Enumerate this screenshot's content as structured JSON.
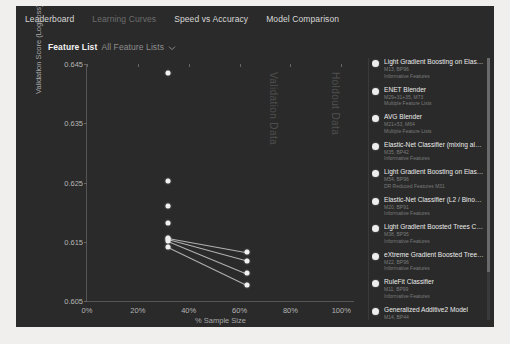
{
  "tabs": [
    {
      "label": "Leaderboard",
      "active": false
    },
    {
      "label": "Learning Curves",
      "active": true
    },
    {
      "label": "Speed vs Accuracy",
      "active": false
    },
    {
      "label": "Model Comparison",
      "active": false
    }
  ],
  "filter": {
    "label": "Feature List",
    "value": "All Feature Lists",
    "caret_icon": "chevron-down-icon"
  },
  "watermarks": [
    "Validation Data",
    "Holdout Data"
  ],
  "legend": {
    "items": [
      {
        "title": "Light Gradient Boosting on ElasticNet...",
        "code": "M13, BP96",
        "features": "Informative Features",
        "color": "#ededed"
      },
      {
        "title": "ENET Blender",
        "code": "M29+31+35, M73",
        "features": "Multiple Feature Lists",
        "color": "#ededed"
      },
      {
        "title": "AVG Blender",
        "code": "M21+53, M64",
        "features": "Multiple Feature Lists",
        "color": "#ededed"
      },
      {
        "title": "Elastic-Net Classifier (mixing alpha=...",
        "code": "M35, BP42",
        "features": "Informative Features",
        "color": "#ededed"
      },
      {
        "title": "Light Gradient Boosting on ElasticNet...",
        "code": "M54, BP96",
        "features": "DR Reduced Features M31",
        "color": "#ededed"
      },
      {
        "title": "Elastic-Net Classifier (L2 / Binomial...",
        "code": "M20, BP91",
        "features": "Informative Features",
        "color": "#ededed"
      },
      {
        "title": "Light Gradient Boosted Trees Classifi...",
        "code": "M38, BP95",
        "features": "Informative Features",
        "color": "#ededed"
      },
      {
        "title": "eXtreme Gradient Boosted Trees Classi...",
        "code": "M22, BP96",
        "features": "Informative Features",
        "color": "#ededed"
      },
      {
        "title": "RuleFit Classifier",
        "code": "M11, BP99",
        "features": "Informative Features",
        "color": "#ededed"
      },
      {
        "title": "Generalized Additive2 Model",
        "code": "M14, BP44",
        "features": "Informative Features",
        "color": "#ededed"
      }
    ]
  },
  "chart_data": {
    "type": "line",
    "title": "",
    "xlabel": "% Sample Size",
    "ylabel": "Validation Score (LogLoss)",
    "xlim": [
      0,
      105
    ],
    "ylim": [
      0.605,
      0.645
    ],
    "xticks": [
      "0%",
      "20%",
      "40%",
      "60%",
      "80%",
      "100%"
    ],
    "xtick_values": [
      0,
      20,
      40,
      60,
      80,
      100
    ],
    "yticks": [
      "0.645",
      "0.635",
      "0.625",
      "0.615",
      "0.605"
    ],
    "ytick_values": [
      0.645,
      0.635,
      0.625,
      0.615,
      0.605
    ],
    "grid": false,
    "legend_position": "right",
    "series": [
      {
        "name": "Light Gradient Boosting on ElasticNet...",
        "x": [
          32
        ],
        "y": [
          0.6434
        ]
      },
      {
        "name": "ENET Blender",
        "x": [
          32
        ],
        "y": [
          0.6252
        ]
      },
      {
        "name": "AVG Blender",
        "x": [
          32
        ],
        "y": [
          0.6211
        ]
      },
      {
        "name": "Elastic-Net Classifier (mixing alpha=...",
        "x": [
          32
        ],
        "y": [
          0.6181
        ]
      },
      {
        "name": "Light Gradient Boosting on ElasticNet...",
        "x": [
          32,
          63
        ],
        "y": [
          0.6156,
          0.6132
        ]
      },
      {
        "name": "Elastic-Net Classifier (L2 / Binomial...",
        "x": [
          32,
          63
        ],
        "y": [
          0.6154,
          0.6118
        ]
      },
      {
        "name": "Light Gradient Boosted Trees Classifi...",
        "x": [
          32,
          63
        ],
        "y": [
          0.6152,
          0.6097
        ]
      },
      {
        "name": "eXtreme Gradient Boosted Trees Classi...",
        "x": [
          32,
          63
        ],
        "y": [
          0.6141,
          0.6077
        ]
      }
    ]
  }
}
